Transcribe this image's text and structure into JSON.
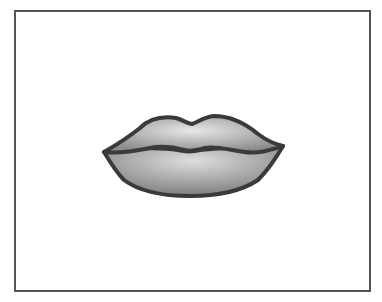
{
  "image": {
    "subject": "lips-illustration",
    "colors": {
      "outline": "#3a3a3a",
      "fill_light": "#e4e4e4",
      "fill_dark": "#8a8a8a",
      "frame_border": "#555555",
      "background": "#ffffff"
    }
  }
}
